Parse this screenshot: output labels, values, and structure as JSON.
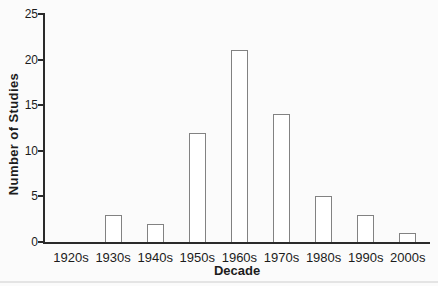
{
  "figure": {
    "background": "#fbfbfb",
    "axis_color": "#2a2a2a",
    "text_color": "#1c1c1c",
    "bar_fill": "#ffffff",
    "bar_stroke": "#828282"
  },
  "chart_data": {
    "type": "bar",
    "title": "",
    "xlabel": "Decade",
    "ylabel": "Number of Studies",
    "categories": [
      "1920s",
      "1930s",
      "1940s",
      "1950s",
      "1960s",
      "1970s",
      "1980s",
      "1990s",
      "2000s"
    ],
    "values": [
      0,
      3,
      2,
      12,
      21,
      14,
      5,
      3,
      1
    ],
    "ylim": [
      0,
      25
    ],
    "yticks": [
      0,
      5,
      10,
      15,
      20,
      25
    ],
    "grid": false,
    "legend": "none",
    "bar_orientation": "vertical"
  }
}
